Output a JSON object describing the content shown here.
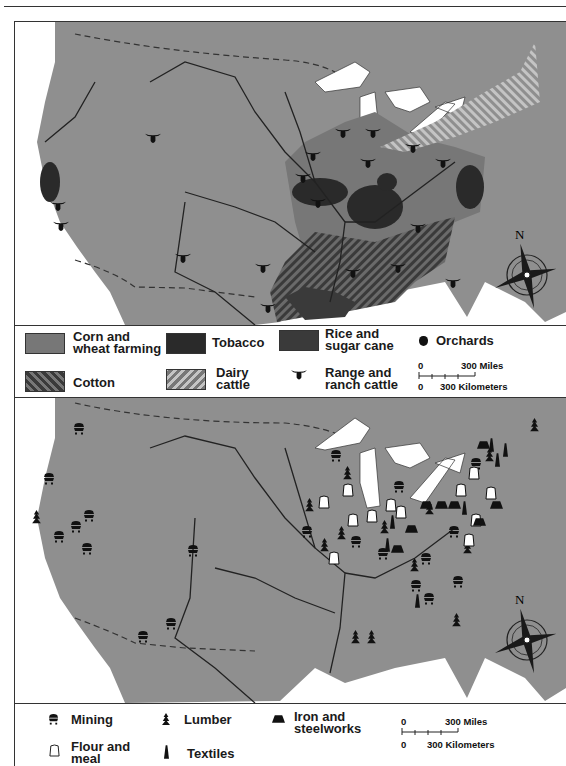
{
  "colors": {
    "land": "#8f8f8f",
    "water": "#ffffff",
    "corn_wheat": "#777777",
    "tobacco": "#2a2a2a",
    "rice_sugar": "#3a3a3a",
    "cotton_hatch": "#3a3a3a",
    "dairy_hatch": "#b0b0b0",
    "ink": "#111111"
  },
  "map_agriculture": {
    "compass_label": "N",
    "legend": {
      "items": [
        {
          "label_line1": "Corn and",
          "label_line2": "wheat farming",
          "icon": "corn-wheat-swatch"
        },
        {
          "label_line1": "Tobacco",
          "label_line2": "",
          "icon": "tobacco-swatch"
        },
        {
          "label_line1": "Rice and",
          "label_line2": "sugar cane",
          "icon": "rice-sugar-swatch"
        },
        {
          "label_line1": "Orchards",
          "label_line2": "",
          "icon": "apple-icon"
        },
        {
          "label_line1": "Cotton",
          "label_line2": "",
          "icon": "cotton-hatch-swatch"
        },
        {
          "label_line1": "Dairy",
          "label_line2": "cattle",
          "icon": "dairy-hatch-swatch"
        },
        {
          "label_line1": "Range and",
          "label_line2": "ranch cattle",
          "icon": "steer-head-icon"
        }
      ],
      "scale": {
        "zero_top": "0",
        "miles": "300 Miles",
        "zero_bottom": "0",
        "km": "300 Kilometers"
      }
    }
  },
  "map_industry": {
    "compass_label": "N",
    "legend": {
      "items": [
        {
          "label_line1": "Mining",
          "label_line2": "",
          "icon": "mine-cart-icon"
        },
        {
          "label_line1": "Lumber",
          "label_line2": "",
          "icon": "pine-tree-icon"
        },
        {
          "label_line1": "Iron and",
          "label_line2": "steelworks",
          "icon": "furnace-icon"
        },
        {
          "label_line1": "Flour and",
          "label_line2": "meal",
          "icon": "flour-sack-icon"
        },
        {
          "label_line1": "Textiles",
          "label_line2": "",
          "icon": "spindle-icon"
        }
      ],
      "scale": {
        "zero_top": "0",
        "miles": "300 Miles",
        "zero_bottom": "0",
        "km": "300 Kilometers"
      }
    }
  }
}
